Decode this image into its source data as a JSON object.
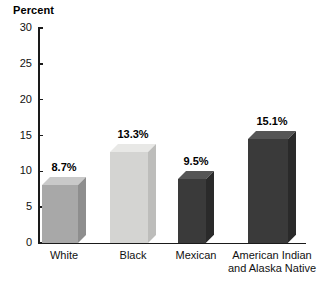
{
  "chart_data": {
    "type": "bar",
    "title": "Percent",
    "xlabel": "",
    "ylabel": "Percent",
    "ylim": [
      0,
      30
    ],
    "yticks": [
      0,
      5,
      10,
      15,
      20,
      25,
      30
    ],
    "ytick_labels": [
      "0",
      "5",
      "10",
      "15",
      "20",
      "25",
      "30"
    ],
    "grid": false,
    "legend": "none",
    "categories": [
      "White",
      "Black",
      "Mexican",
      "American Indian\nand Alaska Native"
    ],
    "values": [
      8.7,
      13.3,
      9.5,
      15.1
    ],
    "value_labels": [
      "8.7%",
      "13.3%",
      "9.5%",
      "15.1%"
    ],
    "bar_colors": [
      "#a8a8a8",
      "#d4d4d2",
      "#3a3a3a",
      "#3a3a3a"
    ],
    "bar_top_colors": [
      "#c9c9c9",
      "#e8e8e6",
      "#555555",
      "#555555"
    ],
    "bar_side_colors": [
      "#8e8e8e",
      "#bdbdbb",
      "#2a2a2a",
      "#2a2a2a"
    ],
    "style": "3d-bars",
    "axis_color": "#1a1a1a",
    "background": "#ffffff"
  },
  "bars": [
    {
      "category": "White",
      "value": 8.7,
      "label": "8.7%",
      "left": 42,
      "width": 36
    },
    {
      "category": "Black",
      "value": 13.3,
      "label": "13.3%",
      "left": 110,
      "width": 38
    },
    {
      "category": "Mexican",
      "value": 9.5,
      "label": "9.5%",
      "left": 178,
      "width": 28
    },
    {
      "category": "American Indian\nand Alaska Native",
      "value": 15.1,
      "label": "15.1%",
      "left": 248,
      "width": 40
    }
  ],
  "yticks": [
    {
      "label": "30",
      "value": 30
    },
    {
      "label": "25",
      "value": 25
    },
    {
      "label": "20",
      "value": 20
    },
    {
      "label": "15",
      "value": 15
    },
    {
      "label": "10",
      "value": 10
    },
    {
      "label": "5",
      "value": 5
    },
    {
      "label": "0",
      "value": 0
    }
  ]
}
